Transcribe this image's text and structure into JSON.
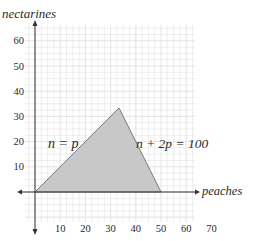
{
  "chart_data": {
    "type": "line",
    "title": "",
    "xlabel": "peaches",
    "ylabel": "nectarines",
    "xlim": [
      -5,
      75
    ],
    "ylim": [
      -10,
      70
    ],
    "x_ticks": [
      10,
      20,
      30,
      40,
      50,
      60,
      70
    ],
    "y_ticks": [
      10,
      20,
      30,
      40,
      50,
      60
    ],
    "grid": true,
    "series": [
      {
        "name": "n = p",
        "points": [
          [
            0,
            0
          ],
          [
            33.33,
            33.33
          ]
        ]
      },
      {
        "name": "n + 2p = 100",
        "points": [
          [
            33.33,
            33.33
          ],
          [
            50,
            0
          ]
        ]
      }
    ],
    "shaded_region": {
      "vertices": [
        [
          0,
          0
        ],
        [
          33.33,
          33.33
        ],
        [
          50,
          0
        ]
      ],
      "fill": "#c8c8c8"
    },
    "annotations": [
      {
        "text": "n = p",
        "x": 14,
        "y": 20
      },
      {
        "text": "n + 2p = 100",
        "x": 58,
        "y": 20
      }
    ]
  },
  "labels": {
    "y_axis": "nectarines",
    "x_axis": "peaches",
    "eq1": "n = p",
    "eq2": "n + 2p = 100"
  },
  "colors": {
    "grid": "#dcdcdc",
    "axis": "#333333",
    "region": "#c8c8c8",
    "region_stroke": "#7a7a7a"
  }
}
